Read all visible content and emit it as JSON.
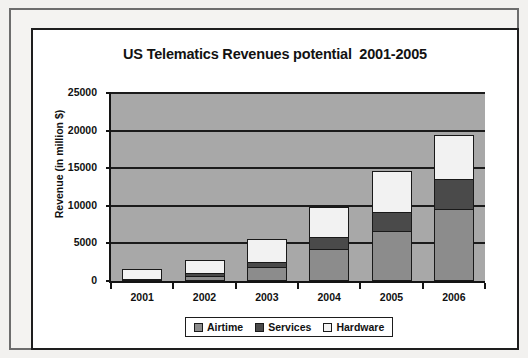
{
  "chart_data": {
    "type": "bar",
    "subtype": "stacked-column",
    "title": "US Telematics Revenues potential  2001-2005",
    "xlabel": "",
    "ylabel": "Revenue (in million $)",
    "categories": [
      "2001",
      "2002",
      "2003",
      "2004",
      "2005",
      "2006"
    ],
    "series": [
      {
        "name": "Airtime",
        "color": "#8c8c8c",
        "values": [
          200,
          700,
          1800,
          4200,
          6600,
          9600
        ]
      },
      {
        "name": "Services",
        "color": "#4a4a4a",
        "values": [
          0,
          400,
          700,
          1600,
          2600,
          4000
        ]
      },
      {
        "name": "Hardware",
        "color": "#f2f2f2",
        "values": [
          1300,
          1700,
          3100,
          4000,
          5400,
          5800
        ]
      }
    ],
    "totals": [
      1500,
      2800,
      5600,
      9800,
      14600,
      19400
    ],
    "ylim": [
      0,
      25000
    ],
    "yticks": [
      0,
      5000,
      10000,
      15000,
      20000,
      25000
    ],
    "ytick_labels": [
      "0",
      "5000",
      "10000",
      "15000",
      "20000",
      "25000"
    ],
    "grid": true,
    "grid_axis": "y",
    "legend_position": "bottom-center",
    "plot_background": "#a8a8a8",
    "axis_color": "#141414"
  },
  "legend": {
    "items": [
      {
        "label": "Airtime"
      },
      {
        "label": "Services"
      },
      {
        "label": "Hardware"
      }
    ]
  }
}
